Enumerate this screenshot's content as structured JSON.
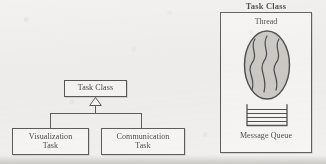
{
  "figure": {
    "background_color": "#f4f3f1",
    "ink_color": "#3a3a3a"
  },
  "class_hierarchy": {
    "name": "task-class-hierarchy",
    "relationship": "generalization",
    "parent": {
      "label": "Task Class"
    },
    "children": [
      {
        "label": "Visualization\nTask"
      },
      {
        "label": "Communication\nTask"
      }
    ]
  },
  "task_class_detail": {
    "title": "Task Class",
    "thread": {
      "label": "Thread",
      "shape": "ellipse",
      "fill_color": "#c9c6c1",
      "squiggle_count": 3
    },
    "message_queue": {
      "label": "Message Queue",
      "shape": "open-top-container",
      "line_count": 5
    }
  }
}
